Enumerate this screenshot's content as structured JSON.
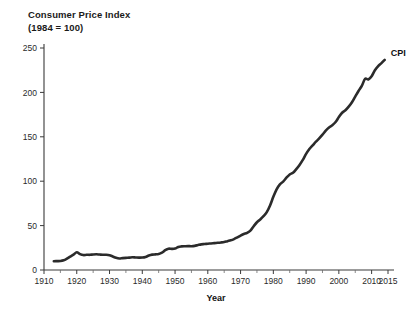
{
  "chart_data": {
    "type": "line",
    "title": "Consumer Price Index",
    "subtitle": "(1984 = 100)",
    "xlabel": "Year",
    "ylabel": "",
    "xlim": [
      1910,
      2015
    ],
    "ylim": [
      0,
      250
    ],
    "grid": false,
    "legend_position": "end-of-line",
    "series": [
      {
        "name": "CPI",
        "color": "#2b2b2b",
        "x": [
          1913,
          1914,
          1915,
          1916,
          1917,
          1918,
          1919,
          1920,
          1921,
          1922,
          1923,
          1924,
          1925,
          1926,
          1927,
          1928,
          1929,
          1930,
          1931,
          1932,
          1933,
          1934,
          1935,
          1936,
          1937,
          1938,
          1939,
          1940,
          1941,
          1942,
          1943,
          1944,
          1945,
          1946,
          1947,
          1948,
          1949,
          1950,
          1951,
          1952,
          1953,
          1954,
          1955,
          1956,
          1957,
          1958,
          1959,
          1960,
          1961,
          1962,
          1963,
          1964,
          1965,
          1966,
          1967,
          1968,
          1969,
          1970,
          1971,
          1972,
          1973,
          1974,
          1975,
          1976,
          1977,
          1978,
          1979,
          1980,
          1981,
          1982,
          1983,
          1984,
          1985,
          1986,
          1987,
          1988,
          1989,
          1990,
          1991,
          1992,
          1993,
          1994,
          1995,
          1996,
          1997,
          1998,
          1999,
          2000,
          2001,
          2002,
          2003,
          2004,
          2005,
          2006,
          2007,
          2008,
          2009,
          2010,
          2011,
          2012,
          2013,
          2014
        ],
        "values": [
          9.9,
          10.0,
          10.1,
          10.9,
          12.8,
          15.1,
          17.3,
          20.0,
          17.9,
          16.8,
          17.1,
          17.1,
          17.5,
          17.7,
          17.4,
          17.2,
          17.2,
          16.7,
          15.2,
          13.7,
          13.0,
          13.4,
          13.7,
          13.9,
          14.4,
          14.1,
          13.9,
          14.0,
          14.7,
          16.3,
          17.3,
          17.6,
          18.0,
          19.5,
          22.3,
          24.0,
          23.8,
          24.1,
          26.0,
          26.6,
          26.8,
          26.9,
          26.8,
          27.2,
          28.1,
          28.9,
          29.2,
          29.6,
          29.9,
          30.3,
          30.6,
          31.0,
          31.5,
          32.5,
          33.4,
          34.8,
          36.7,
          38.8,
          40.5,
          41.8,
          44.4,
          49.3,
          53.8,
          56.9,
          60.6,
          65.2,
          72.6,
          82.4,
          90.9,
          96.5,
          99.6,
          103.9,
          107.6,
          109.6,
          113.6,
          118.3,
          124.0,
          130.7,
          136.2,
          140.3,
          144.5,
          148.2,
          152.4,
          156.9,
          160.5,
          163.0,
          166.6,
          172.2,
          177.1,
          179.9,
          184.0,
          188.9,
          195.3,
          201.6,
          207.3,
          215.3,
          214.5,
          218.1,
          224.9,
          229.6,
          233.0,
          236.7
        ]
      }
    ],
    "y_ticks": [
      0,
      50,
      100,
      150,
      200,
      250
    ],
    "x_ticks": [
      1910,
      1920,
      1930,
      1940,
      1950,
      1960,
      1970,
      1980,
      1990,
      2000,
      2010,
      2015
    ],
    "x_minor_ticks": [
      1915,
      1925,
      1935,
      1945,
      1955,
      1965,
      1975,
      1985,
      1995,
      2005
    ],
    "series_end_label": "CPI"
  }
}
